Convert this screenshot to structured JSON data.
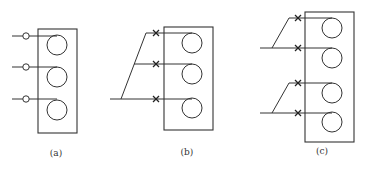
{
  "figure": {
    "panels": [
      {
        "id": "a",
        "label": "(a)",
        "lamp_count": 3,
        "switch_symbol": "circle",
        "wiring": "independent"
      },
      {
        "id": "b",
        "label": "(b)",
        "lamp_count": 3,
        "switch_symbol": "cross",
        "wiring": "single-feed-branched"
      },
      {
        "id": "c",
        "label": "(c)",
        "lamp_count": 4,
        "switch_symbol": "cross",
        "wiring": "two-feeds-paired"
      }
    ],
    "colors": {
      "line": "#333333",
      "background": "#ffffff"
    }
  }
}
